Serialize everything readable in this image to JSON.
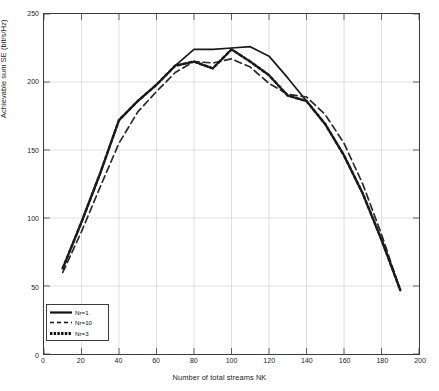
{
  "chart_data": {
    "type": "line",
    "title": "",
    "xlabel": "Number of total streams NK",
    "ylabel": "Achievable sum SE (bit/s/Hz)",
    "xlim": [
      0,
      200
    ],
    "ylim": [
      0,
      250
    ],
    "xticks": [
      0,
      20,
      40,
      60,
      80,
      100,
      120,
      140,
      160,
      180,
      200
    ],
    "yticks": [
      0,
      50,
      100,
      150,
      200,
      250
    ],
    "grid": true,
    "legend_position": "lower-left",
    "series": [
      {
        "name": "Nr=1",
        "style": "solid",
        "color": "#1a1a1a",
        "x": [
          10,
          20,
          30,
          40,
          50,
          60,
          70,
          80,
          90,
          100,
          110,
          120,
          130,
          140,
          150,
          160,
          170,
          180,
          190
        ],
        "y": [
          63,
          97,
          133,
          172,
          186,
          198,
          212,
          224,
          224,
          225,
          226,
          219,
          203,
          186,
          169,
          146,
          118,
          84,
          47
        ]
      },
      {
        "name": "Nr=10",
        "style": "dashed",
        "color": "#2a2a2a",
        "x": [
          10,
          20,
          30,
          40,
          50,
          60,
          70,
          80,
          90,
          100,
          110,
          120,
          130,
          140,
          150,
          160,
          170,
          180,
          190
        ],
        "y": [
          60,
          90,
          123,
          155,
          178,
          193,
          207,
          215,
          214,
          217,
          211,
          199,
          191,
          189,
          176,
          155,
          125,
          88,
          47
        ]
      },
      {
        "name": "Nr=3",
        "style": "dotted-thick",
        "color": "#1a1a1a",
        "x": [
          10,
          20,
          30,
          40,
          50,
          60,
          70,
          80,
          90,
          100,
          110,
          120,
          130,
          140,
          150,
          160,
          170,
          180,
          190
        ],
        "y": [
          63,
          97,
          133,
          172,
          186,
          198,
          212,
          215,
          210,
          224,
          215,
          205,
          190,
          186,
          169,
          146,
          118,
          84,
          47
        ]
      }
    ]
  },
  "legend": {
    "items": [
      {
        "label": "Nr=1"
      },
      {
        "label": "Nr=10"
      },
      {
        "label": "Nr=3"
      }
    ]
  }
}
